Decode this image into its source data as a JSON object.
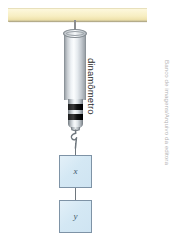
{
  "figure": {
    "type": "physics-diagram",
    "title_label": "dinamômetro",
    "credit": "Banco de imagens/Arquivo da editora",
    "background_color": "#ffffff",
    "ceiling": {
      "name": "support-ceiling-bar",
      "color": "#f7eec2"
    },
    "dynamometer": {
      "label": "dinamômetro",
      "body_color": "#e6ebef",
      "band_color": "#000000",
      "band_count": 2
    },
    "blocks": [
      {
        "id": "block-x",
        "label": "x",
        "fill": "#d4e8f4",
        "stroke": "#7e93a6"
      },
      {
        "id": "block-y",
        "label": "y",
        "fill": "#d4e8f4",
        "stroke": "#7e93a6"
      }
    ],
    "connectors": {
      "rod_color": "#8b8d90",
      "string_color": "#6e767d",
      "hook_color": "#6e767d"
    }
  }
}
